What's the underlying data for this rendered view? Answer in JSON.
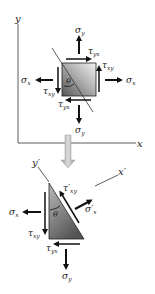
{
  "top": {
    "axis_y": "y",
    "axis_x": "x",
    "sigma_y_top": "σ",
    "sigma_y_top_sub": "y",
    "sigma_y_bottom": "σ",
    "sigma_y_bottom_sub": "y",
    "sigma_x_left": "σ",
    "sigma_x_left_sub": "x",
    "sigma_x_right": "σ",
    "sigma_x_right_sub": "x",
    "tau_yx_top": "τ",
    "tau_yx_top_sub": "yx",
    "tau_yx_bottom": "τ",
    "tau_yx_bottom_sub": "yx",
    "tau_xy_right": "τ",
    "tau_xy_right_sub": "xy",
    "tau_xy_left": "τ",
    "tau_xy_left_sub": "xy",
    "theta": "θ"
  },
  "bottom": {
    "axis_y_prime": "y′",
    "axis_x_prime": "x′",
    "tau_xy_prime": "τ′",
    "tau_xy_prime_sub": "xy",
    "sigma_x_prime": "σ′",
    "sigma_x_prime_sub": "x",
    "sigma_x": "σ",
    "sigma_x_sub": "x",
    "tau_xy": "τ",
    "tau_xy_sub": "xy",
    "tau_yx": "τ",
    "tau_yx_sub": "yx",
    "sigma_y": "σ",
    "sigma_y_sub": "y",
    "theta": "θ"
  },
  "colors": {
    "arrow": "#111111",
    "axis": "#333333",
    "transition_arrow": "#b0b0b0"
  }
}
